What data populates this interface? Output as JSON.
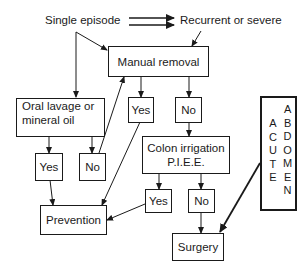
{
  "diagram": {
    "type": "flowchart",
    "top_labels": {
      "single": "Single episode",
      "recurrent": "Recurrent or severe"
    },
    "nodes": {
      "manual_removal": "Manual removal",
      "oral_lavage_line1": "Oral lavage or",
      "oral_lavage_line2": "mineral oil",
      "oral_yes": "Yes",
      "oral_no": "No",
      "manual_yes": "Yes",
      "manual_no": "No",
      "colon_line1": "Colon irrigation",
      "colon_line2": "P.I.E.E.",
      "colon_yes": "Yes",
      "colon_no": "No",
      "prevention": "Prevention",
      "surgery": "Surgery"
    },
    "side_box": {
      "word1": [
        "A",
        "C",
        "U",
        "T",
        "E"
      ],
      "word2": [
        "A",
        "B",
        "D",
        "O",
        "M",
        "E",
        "N"
      ],
      "word1_full": "ACUTE",
      "word2_full": "ABDOMEN"
    },
    "edges": [
      {
        "from": "Single episode",
        "to": "Recurrent or severe",
        "style": "double-arrow"
      },
      {
        "from": "Single episode",
        "to": "Manual removal"
      },
      {
        "from": "Single episode",
        "to": "Oral lavage or mineral oil"
      },
      {
        "from": "Recurrent or severe",
        "to": "Manual removal"
      },
      {
        "from": "Manual removal",
        "to": "Yes"
      },
      {
        "from": "Manual removal",
        "to": "No"
      },
      {
        "from": "Oral lavage or mineral oil",
        "to": "Yes"
      },
      {
        "from": "Oral lavage or mineral oil",
        "to": "No"
      },
      {
        "from": "Oral lavage: No",
        "to": "Manual removal"
      },
      {
        "from": "Oral lavage: Yes",
        "to": "Prevention"
      },
      {
        "from": "Manual removal: Yes",
        "to": "Prevention"
      },
      {
        "from": "Manual removal: No",
        "to": "Colon irrigation P.I.E.E."
      },
      {
        "from": "Colon irrigation P.I.E.E.",
        "to": "Yes"
      },
      {
        "from": "Colon irrigation P.I.E.E.",
        "to": "No"
      },
      {
        "from": "Colon irrigation: Yes",
        "to": "Prevention"
      },
      {
        "from": "Colon irrigation: No",
        "to": "Surgery"
      },
      {
        "from": "ACUTE ABDOMEN",
        "to": "Surgery",
        "style": "bold"
      }
    ]
  }
}
